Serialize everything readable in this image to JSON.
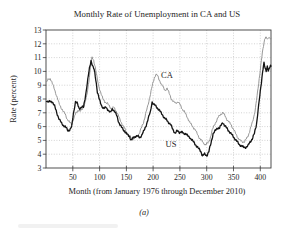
{
  "figure": {
    "subcaption": "(a)"
  },
  "chart_data": {
    "type": "line",
    "title": "Monthly Rate of Unemployment in CA and US",
    "xlabel": "Month (from January 1976 through December 2010)",
    "ylabel": "Rate (percent)",
    "xlim": [
      0,
      420
    ],
    "ylim": [
      3,
      13
    ],
    "xticks": [
      50,
      100,
      150,
      200,
      250,
      300,
      350,
      400
    ],
    "yticks": [
      3,
      4,
      5,
      6,
      7,
      8,
      9,
      10,
      11,
      12,
      13
    ],
    "grid": "dotted",
    "legend": "inline-labels",
    "series": [
      {
        "name": "CA",
        "color": "#8c8c8c",
        "stroke_width": 0.9,
        "label": {
          "text": "CA"
        },
        "points": [
          [
            1,
            9.2
          ],
          [
            4,
            9.4
          ],
          [
            8,
            9.5
          ],
          [
            12,
            9.1
          ],
          [
            16,
            8.7
          ],
          [
            20,
            8.2
          ],
          [
            24,
            7.7
          ],
          [
            28,
            7.4
          ],
          [
            32,
            7.1
          ],
          [
            36,
            6.9
          ],
          [
            40,
            6.5
          ],
          [
            44,
            6.3
          ],
          [
            48,
            6.2
          ],
          [
            52,
            6.6
          ],
          [
            56,
            7.0
          ],
          [
            60,
            7.2
          ],
          [
            64,
            7.1
          ],
          [
            68,
            7.3
          ],
          [
            72,
            7.6
          ],
          [
            76,
            8.2
          ],
          [
            80,
            9.3
          ],
          [
            84,
            10.6
          ],
          [
            86,
            11.0
          ],
          [
            89,
            10.8
          ],
          [
            92,
            10.3
          ],
          [
            95,
            9.6
          ],
          [
            98,
            9.0
          ],
          [
            102,
            8.5
          ],
          [
            106,
            8.0
          ],
          [
            110,
            7.8
          ],
          [
            114,
            7.7
          ],
          [
            118,
            7.5
          ],
          [
            122,
            7.3
          ],
          [
            126,
            7.4
          ],
          [
            130,
            7.2
          ],
          [
            134,
            6.9
          ],
          [
            138,
            6.5
          ],
          [
            142,
            6.2
          ],
          [
            146,
            5.9
          ],
          [
            150,
            5.6
          ],
          [
            154,
            5.4
          ],
          [
            158,
            5.2
          ],
          [
            162,
            5.1
          ],
          [
            166,
            5.2
          ],
          [
            170,
            5.3
          ],
          [
            174,
            5.5
          ],
          [
            178,
            5.9
          ],
          [
            182,
            6.3
          ],
          [
            186,
            6.9
          ],
          [
            190,
            7.5
          ],
          [
            194,
            8.2
          ],
          [
            198,
            8.9
          ],
          [
            202,
            9.5
          ],
          [
            205,
            9.8
          ],
          [
            208,
            9.7
          ],
          [
            211,
            9.4
          ],
          [
            214,
            9.2
          ],
          [
            218,
            8.9
          ],
          [
            222,
            8.6
          ],
          [
            226,
            8.8
          ],
          [
            230,
            8.4
          ],
          [
            234,
            8.0
          ],
          [
            238,
            7.8
          ],
          [
            242,
            7.7
          ],
          [
            246,
            7.8
          ],
          [
            250,
            7.6
          ],
          [
            254,
            7.3
          ],
          [
            258,
            7.1
          ],
          [
            262,
            6.8
          ],
          [
            266,
            6.5
          ],
          [
            270,
            6.2
          ],
          [
            274,
            6.0
          ],
          [
            278,
            5.8
          ],
          [
            282,
            5.5
          ],
          [
            286,
            5.2
          ],
          [
            290,
            5.0
          ],
          [
            294,
            4.8
          ],
          [
            298,
            4.7
          ],
          [
            302,
            4.8
          ],
          [
            306,
            5.1
          ],
          [
            310,
            5.7
          ],
          [
            314,
            6.1
          ],
          [
            318,
            6.4
          ],
          [
            322,
            6.7
          ],
          [
            326,
            6.9
          ],
          [
            330,
            7.0
          ],
          [
            334,
            6.8
          ],
          [
            338,
            6.5
          ],
          [
            342,
            6.3
          ],
          [
            346,
            6.1
          ],
          [
            350,
            5.8
          ],
          [
            354,
            5.5
          ],
          [
            358,
            5.2
          ],
          [
            362,
            5.0
          ],
          [
            366,
            4.9
          ],
          [
            370,
            4.9
          ],
          [
            374,
            5.1
          ],
          [
            378,
            5.4
          ],
          [
            382,
            5.9
          ],
          [
            386,
            6.4
          ],
          [
            390,
            7.1
          ],
          [
            393,
            7.9
          ],
          [
            396,
            8.8
          ],
          [
            399,
            9.8
          ],
          [
            402,
            10.8
          ],
          [
            405,
            11.6
          ],
          [
            408,
            12.3
          ],
          [
            410,
            12.55
          ],
          [
            412,
            12.4
          ],
          [
            414,
            12.3
          ],
          [
            416,
            12.45
          ],
          [
            418,
            12.4
          ],
          [
            420,
            12.45
          ]
        ]
      },
      {
        "name": "US",
        "color": "#141414",
        "stroke_width": 1.3,
        "label": {
          "text": "US"
        },
        "points": [
          [
            1,
            7.9
          ],
          [
            4,
            7.8
          ],
          [
            8,
            7.8
          ],
          [
            12,
            7.8
          ],
          [
            16,
            7.5
          ],
          [
            20,
            7.0
          ],
          [
            24,
            6.6
          ],
          [
            28,
            6.3
          ],
          [
            32,
            6.1
          ],
          [
            36,
            6.0
          ],
          [
            41,
            5.7
          ],
          [
            45,
            5.8
          ],
          [
            48,
            6.0
          ],
          [
            51,
            6.9
          ],
          [
            55,
            7.8
          ],
          [
            58,
            7.7
          ],
          [
            62,
            7.3
          ],
          [
            66,
            7.4
          ],
          [
            70,
            7.4
          ],
          [
            74,
            8.3
          ],
          [
            78,
            9.4
          ],
          [
            81,
            10.2
          ],
          [
            84,
            10.8
          ],
          [
            87,
            10.4
          ],
          [
            90,
            10.1
          ],
          [
            93,
            9.4
          ],
          [
            96,
            8.5
          ],
          [
            100,
            7.9
          ],
          [
            104,
            7.5
          ],
          [
            108,
            7.3
          ],
          [
            112,
            7.4
          ],
          [
            116,
            7.2
          ],
          [
            120,
            7.0
          ],
          [
            124,
            7.3
          ],
          [
            128,
            7.1
          ],
          [
            132,
            6.8
          ],
          [
            136,
            6.3
          ],
          [
            140,
            6.0
          ],
          [
            144,
            5.8
          ],
          [
            148,
            5.6
          ],
          [
            152,
            5.4
          ],
          [
            156,
            5.3
          ],
          [
            159,
            5.0
          ],
          [
            163,
            5.2
          ],
          [
            167,
            5.3
          ],
          [
            171,
            5.3
          ],
          [
            175,
            5.2
          ],
          [
            179,
            5.4
          ],
          [
            183,
            5.7
          ],
          [
            187,
            6.1
          ],
          [
            191,
            6.6
          ],
          [
            195,
            7.1
          ],
          [
            198,
            7.8
          ],
          [
            201,
            7.6
          ],
          [
            205,
            7.5
          ],
          [
            209,
            7.3
          ],
          [
            213,
            7.1
          ],
          [
            217,
            6.9
          ],
          [
            221,
            6.6
          ],
          [
            225,
            6.5
          ],
          [
            229,
            6.3
          ],
          [
            233,
            6.1
          ],
          [
            237,
            5.8
          ],
          [
            241,
            5.5
          ],
          [
            245,
            5.7
          ],
          [
            249,
            5.6
          ],
          [
            253,
            5.6
          ],
          [
            257,
            5.5
          ],
          [
            261,
            5.5
          ],
          [
            265,
            5.3
          ],
          [
            269,
            5.2
          ],
          [
            273,
            5.0
          ],
          [
            277,
            4.8
          ],
          [
            281,
            4.6
          ],
          [
            285,
            4.4
          ],
          [
            289,
            4.2
          ],
          [
            292,
            3.9
          ],
          [
            296,
            4.0
          ],
          [
            300,
            3.9
          ],
          [
            304,
            4.2
          ],
          [
            308,
            4.8
          ],
          [
            312,
            5.5
          ],
          [
            316,
            5.7
          ],
          [
            320,
            5.9
          ],
          [
            324,
            5.9
          ],
          [
            327,
            6.1
          ],
          [
            330,
            6.3
          ],
          [
            333,
            6.1
          ],
          [
            337,
            5.9
          ],
          [
            341,
            5.7
          ],
          [
            345,
            5.5
          ],
          [
            349,
            5.3
          ],
          [
            353,
            5.1
          ],
          [
            357,
            4.9
          ],
          [
            361,
            4.7
          ],
          [
            365,
            4.6
          ],
          [
            369,
            4.5
          ],
          [
            373,
            4.5
          ],
          [
            377,
            4.6
          ],
          [
            381,
            4.9
          ],
          [
            385,
            5.1
          ],
          [
            389,
            5.5
          ],
          [
            393,
            6.2
          ],
          [
            396,
            7.2
          ],
          [
            399,
            8.2
          ],
          [
            402,
            9.2
          ],
          [
            405,
            10.2
          ],
          [
            407,
            10.6
          ],
          [
            409,
            10.2
          ],
          [
            411,
            10.0
          ],
          [
            413,
            10.4
          ],
          [
            415,
            10.1
          ],
          [
            417,
            10.2
          ],
          [
            419,
            10.4
          ],
          [
            420,
            10.3
          ]
        ]
      }
    ]
  }
}
